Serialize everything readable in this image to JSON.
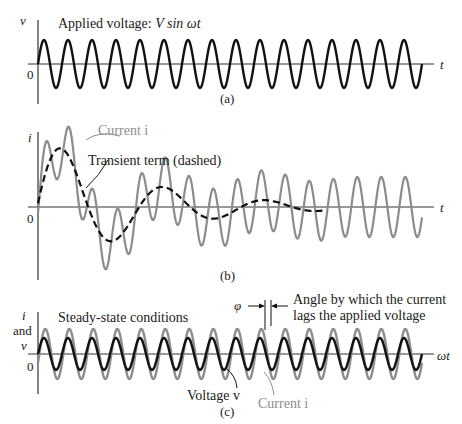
{
  "panels": {
    "a": {
      "caption": "(a)",
      "y_axis_label": "v",
      "x_axis_label": "t",
      "origin_label": "0",
      "title_prefix": "Applied voltage: ",
      "title_expr": "V sin ωt",
      "curve": "voltage v = V sin ωt"
    },
    "b": {
      "caption": "(b)",
      "y_axis_label": "i",
      "x_axis_label": "t",
      "origin_label": "0",
      "current_label": "Current i",
      "transient_label": "Transient term (dashed)"
    },
    "c": {
      "caption": "(c)",
      "y_axis_label_line1": "i",
      "y_axis_label_line2": "and",
      "y_axis_label_line3": "v",
      "x_axis_label": "ωt",
      "origin_label": "0",
      "title": "Steady-state conditions",
      "phi_label": "φ",
      "phase_note_line1": "Angle by which the current",
      "phase_note_line2": "lags the applied voltage",
      "voltage_label": "Voltage v",
      "current_label": "Current i"
    }
  },
  "colors": {
    "voltage": "#111111",
    "current": "#8c8c8c",
    "axis": "#333333"
  },
  "chart_data": [
    {
      "type": "line",
      "title": "Applied voltage: V sin ωt",
      "xlabel": "t",
      "ylabel": "v",
      "series": [
        {
          "name": "Voltage v",
          "form": "V sin ωt",
          "cycles": 16,
          "amplitude_px": 24
        }
      ]
    },
    {
      "type": "line",
      "title": "Transient current",
      "xlabel": "t",
      "ylabel": "i",
      "series": [
        {
          "name": "Current i",
          "form": "steady-state sinusoid + transient"
        },
        {
          "name": "Transient term (dashed)",
          "form": "damped oscillation decaying to zero"
        }
      ]
    },
    {
      "type": "line",
      "title": "Steady-state conditions",
      "xlabel": "ωt",
      "ylabel": "i and v",
      "series": [
        {
          "name": "Voltage v",
          "amplitude_px": 16
        },
        {
          "name": "Current i",
          "amplitude_px": 25,
          "phase_lag": "φ"
        }
      ]
    }
  ]
}
